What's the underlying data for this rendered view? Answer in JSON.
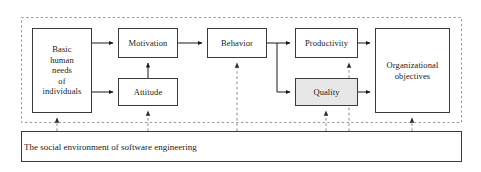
{
  "diagram": {
    "outer_boundary": {
      "style": "dashed",
      "color": "#9a9a9a",
      "x": 21,
      "y": 17,
      "width": 441,
      "height": 106
    },
    "colors": {
      "box_border": "#3a3a3a",
      "box_fill": "#ffffff",
      "shaded_fill": "#e7e7e7",
      "solid_arrow": "#1a1a1a",
      "dashed_arrow": "#6f6f6f",
      "text": "#1a1a1a"
    },
    "nodes": [
      {
        "id": "basic-human-needs",
        "label": "Basic\nhuman\nneeds\nof\nindividuals",
        "x": 32,
        "y": 28,
        "width": 60,
        "height": 85,
        "fill": "white"
      },
      {
        "id": "motivation",
        "label": "Motivation",
        "x": 118,
        "y": 28,
        "width": 60,
        "height": 30,
        "fill": "white"
      },
      {
        "id": "attitude",
        "label": "Attitude",
        "x": 118,
        "y": 78,
        "width": 60,
        "height": 28,
        "fill": "white"
      },
      {
        "id": "behavior",
        "label": "Behavior",
        "x": 207,
        "y": 28,
        "width": 60,
        "height": 30,
        "fill": "white"
      },
      {
        "id": "productivity",
        "label": "Productivity",
        "x": 295,
        "y": 28,
        "width": 63,
        "height": 30,
        "fill": "white"
      },
      {
        "id": "quality",
        "label": "Quality",
        "x": 295,
        "y": 78,
        "width": 63,
        "height": 28,
        "fill": "shaded"
      },
      {
        "id": "organizational-objectives",
        "label": "Organizational\nobjectives",
        "x": 375,
        "y": 28,
        "width": 75,
        "height": 85,
        "fill": "white"
      }
    ],
    "environment_band": {
      "id": "social-environment",
      "label": "The social environment of software engineering",
      "x": 21,
      "y": 131,
      "width": 441,
      "height": 31
    },
    "solid_edges": [
      {
        "from": "basic-human-needs",
        "to": "motivation"
      },
      {
        "from": "basic-human-needs",
        "to": "attitude"
      },
      {
        "from": "attitude",
        "to": "motivation"
      },
      {
        "from": "motivation",
        "to": "behavior"
      },
      {
        "from": "behavior",
        "to": "productivity"
      },
      {
        "from": "behavior",
        "to": "quality"
      },
      {
        "from": "productivity",
        "to": "organizational-objectives"
      },
      {
        "from": "quality",
        "to": "organizational-objectives"
      }
    ],
    "dashed_edges": [
      {
        "from": "social-environment",
        "to": "basic-human-needs"
      },
      {
        "from": "social-environment",
        "to": "attitude"
      },
      {
        "from": "social-environment",
        "to": "behavior"
      },
      {
        "from": "social-environment",
        "to": "quality"
      },
      {
        "from": "quality",
        "to": "productivity"
      },
      {
        "from": "social-environment",
        "to": "organizational-objectives"
      }
    ]
  }
}
